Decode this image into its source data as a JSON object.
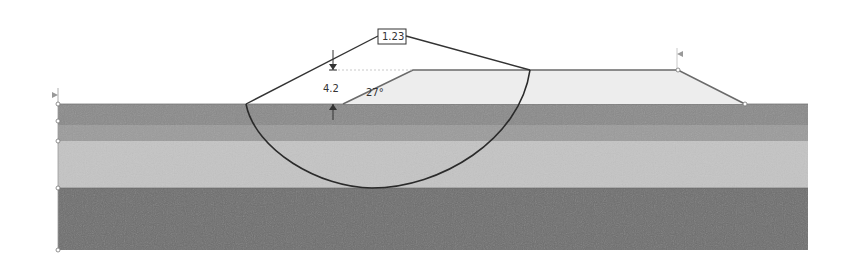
{
  "diagram": {
    "type": "slope-stability-cross-section",
    "factor_of_safety": "1.23",
    "embankment_height": "4.2",
    "slope_angle": "27°",
    "layers": [
      {
        "name": "layer-1",
        "color": "#8a8a8a",
        "top": 104,
        "bottom": 125
      },
      {
        "name": "layer-2",
        "color": "#9b9b9b",
        "top": 125,
        "bottom": 141
      },
      {
        "name": "layer-3",
        "color": "#c4c4c4",
        "top": 141,
        "bottom": 188
      },
      {
        "name": "layer-4",
        "color": "#6e6e6e",
        "top": 188,
        "bottom": 250
      }
    ],
    "embankment_color": "#ededed",
    "line_color": "#333333"
  }
}
